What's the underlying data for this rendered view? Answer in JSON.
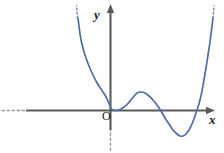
{
  "figure": {
    "background_color": "#ffffff",
    "axis_color": "#5a5a5a",
    "curve_color": "#4a6fa5",
    "label_color": "#1a1a1a",
    "origin_label": "O",
    "x_axis_label": "x",
    "y_axis_label": "y"
  },
  "chart_data": {
    "type": "line",
    "title": "",
    "subtitle": "",
    "xlabel": "x",
    "ylabel": "y",
    "origin_label": "O",
    "grid": false,
    "legend": null,
    "legend_position": "none",
    "axes": {
      "x_axis": {
        "label": "x",
        "arrow_end": "right",
        "dashed_extension": "left",
        "tick_labels": [],
        "visible_range_px": [
          0,
          224
        ]
      },
      "y_axis": {
        "label": "y",
        "arrow_end": "top",
        "dashed_extension": "bottom",
        "tick_labels": [],
        "visible_range_px": [
          0,
          153
        ]
      }
    },
    "series": [
      {
        "name": "curve",
        "color": "#4a6fa5",
        "style": "solid",
        "dotted_continuations": [
          "upper-left",
          "upper-right"
        ],
        "features": {
          "roots": [
            "double root at origin (tangent to x-axis)",
            "simple root right of local minimum"
          ],
          "local_maximum": {
            "x_px": 138,
            "y_px": 92
          },
          "local_minimum": {
            "x_px": 180,
            "y_px": 136
          },
          "tangent_point": {
            "x_px": 110,
            "y_px": 110
          }
        },
        "points_px": [
          [
            78,
            18
          ],
          [
            79,
            26
          ],
          [
            80,
            34
          ],
          [
            81.5,
            42
          ],
          [
            83.5,
            50
          ],
          [
            86,
            58
          ],
          [
            89,
            66
          ],
          [
            92.5,
            74
          ],
          [
            96.5,
            82
          ],
          [
            101,
            89
          ],
          [
            105,
            95
          ],
          [
            108,
            101
          ],
          [
            110,
            106
          ],
          [
            111.5,
            109
          ],
          [
            113,
            110
          ],
          [
            116,
            110.5
          ],
          [
            120,
            109.5
          ],
          [
            124,
            107
          ],
          [
            128,
            103.5
          ],
          [
            132,
            98.5
          ],
          [
            136,
            94
          ],
          [
            138,
            92.5
          ],
          [
            141,
            92
          ],
          [
            145,
            93
          ],
          [
            149,
            96
          ],
          [
            153,
            100
          ],
          [
            157,
            105
          ],
          [
            161,
            111
          ],
          [
            165,
            118
          ],
          [
            169,
            124
          ],
          [
            173,
            130
          ],
          [
            177,
            134
          ],
          [
            180,
            136
          ],
          [
            183,
            136
          ],
          [
            186,
            134
          ],
          [
            189,
            130
          ],
          [
            192,
            124
          ],
          [
            195,
            116
          ],
          [
            198,
            107
          ],
          [
            200,
            100
          ],
          [
            202,
            91
          ],
          [
            204,
            80
          ],
          [
            206,
            68
          ],
          [
            208,
            55
          ],
          [
            210,
            42
          ],
          [
            211.5,
            30
          ],
          [
            213,
            18
          ]
        ]
      }
    ]
  }
}
